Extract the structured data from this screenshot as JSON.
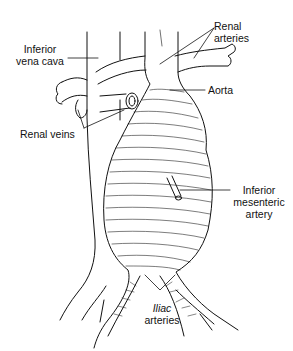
{
  "figure": {
    "labels": {
      "ivc": [
        "Inferior",
        "vena cava"
      ],
      "renal_arteries": [
        "Renal",
        "arteries"
      ],
      "aorta": "Aorta",
      "renal_veins": "Renal veins",
      "ima": [
        "Inferior",
        "mesenteric",
        "artery"
      ],
      "iliac": [
        "Iliac",
        "arteries"
      ]
    },
    "colors": {
      "ink": "#111111",
      "background": "#ffffff"
    }
  }
}
